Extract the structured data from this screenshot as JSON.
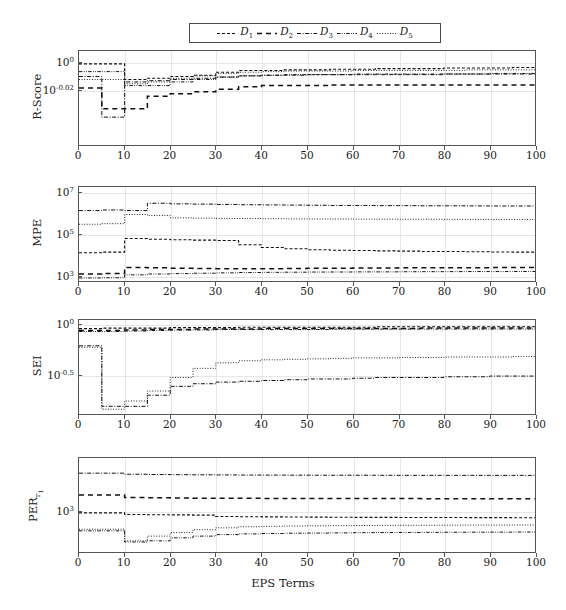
{
  "figure": {
    "xlabel": "EPS Terms",
    "legend_position": "top-center",
    "grid": true
  },
  "legend": {
    "entries": [
      {
        "label": "D",
        "sub": "1",
        "dash": "short-dash",
        "name": "legend-item-d1"
      },
      {
        "label": "D",
        "sub": "2",
        "dash": "long-dash",
        "name": "legend-item-d2"
      },
      {
        "label": "D",
        "sub": "3",
        "dash": "dash-dot",
        "name": "legend-item-d3"
      },
      {
        "label": "D",
        "sub": "4",
        "dash": "dash-dot-dot",
        "name": "legend-item-d4"
      },
      {
        "label": "D",
        "sub": "5",
        "dash": "dotted",
        "name": "legend-item-d5"
      }
    ]
  },
  "xaxis": {
    "ticks": [
      0,
      10,
      20,
      30,
      40,
      50,
      60,
      70,
      80,
      90,
      100
    ],
    "min": 0,
    "max": 100
  },
  "chart_data": [
    {
      "type": "line",
      "title": "",
      "ylabel": "R-Score",
      "xlabel": "",
      "panel": 1,
      "yscale": "log",
      "ytick_labels": [
        "10^0",
        "10^-0.02"
      ],
      "ytick_values": [
        1.0,
        0.955
      ],
      "ylim": [
        0.87,
        1.02
      ],
      "x": [
        0,
        5,
        10,
        15,
        20,
        25,
        30,
        35,
        40,
        45,
        50,
        55,
        60,
        65,
        70,
        75,
        80,
        85,
        90,
        95,
        100
      ],
      "series": [
        {
          "name": "D1",
          "dash": "short-dash",
          "values": [
            0.998,
            0.998,
            0.972,
            0.974,
            0.977,
            0.979,
            0.984,
            0.987,
            0.987,
            0.988,
            0.988,
            0.989,
            0.989,
            0.99,
            0.99,
            0.99,
            0.991,
            0.991,
            0.991,
            0.992,
            0.992
          ]
        },
        {
          "name": "D2",
          "dash": "long-dash",
          "values": [
            0.958,
            0.925,
            0.925,
            0.945,
            0.949,
            0.952,
            0.956,
            0.96,
            0.962,
            0.962,
            0.962,
            0.963,
            0.963,
            0.963,
            0.963,
            0.963,
            0.963,
            0.963,
            0.963,
            0.963,
            0.963
          ]
        },
        {
          "name": "D3",
          "dash": "dash-dot",
          "values": [
            0.977,
            0.912,
            0.968,
            0.97,
            0.972,
            0.974,
            0.976,
            0.978,
            0.979,
            0.979,
            0.98,
            0.98,
            0.98,
            0.98,
            0.98,
            0.98,
            0.981,
            0.981,
            0.981,
            0.981,
            0.981
          ]
        },
        {
          "name": "D4",
          "dash": "dash-dot-dot",
          "values": [
            0.985,
            0.985,
            0.962,
            0.962,
            0.968,
            0.972,
            0.976,
            0.978,
            0.979,
            0.98,
            0.98,
            0.98,
            0.981,
            0.981,
            0.981,
            0.981,
            0.981,
            0.981,
            0.982,
            0.982,
            0.982
          ]
        },
        {
          "name": "D5",
          "dash": "dotted",
          "values": [
            0.972,
            0.972,
            0.965,
            0.968,
            0.974,
            0.978,
            0.982,
            0.984,
            0.985,
            0.986,
            0.986,
            0.986,
            0.987,
            0.987,
            0.987,
            0.987,
            0.987,
            0.988,
            0.988,
            0.988,
            0.988
          ]
        }
      ]
    },
    {
      "type": "line",
      "title": "",
      "ylabel": "MPE",
      "xlabel": "",
      "panel": 2,
      "yscale": "log",
      "ytick_labels": [
        "10^7",
        "10^5",
        "10^3"
      ],
      "ytick_values": [
        10000000,
        100000,
        1000
      ],
      "ylim": [
        500,
        20000000
      ],
      "x": [
        0,
        5,
        10,
        15,
        20,
        25,
        30,
        35,
        40,
        45,
        50,
        55,
        60,
        65,
        70,
        75,
        80,
        85,
        90,
        95,
        100
      ],
      "series": [
        {
          "name": "D1",
          "dash": "short-dash",
          "values": [
            12000,
            13000,
            60000,
            55000,
            52000,
            50000,
            48000,
            30000,
            22000,
            19000,
            17000,
            16000,
            15500,
            15000,
            14500,
            14000,
            13800,
            13500,
            13200,
            13000,
            12800
          ]
        },
        {
          "name": "D2",
          "dash": "long-dash",
          "values": [
            1100,
            1150,
            2300,
            2200,
            2100,
            2050,
            2000,
            2000,
            2000,
            2050,
            2100,
            2100,
            2150,
            2150,
            2200,
            2200,
            2250,
            2250,
            2280,
            2300,
            2300
          ]
        },
        {
          "name": "D3",
          "dash": "dash-dot",
          "values": [
            1400000,
            1500000,
            1400000,
            3200000,
            3000000,
            2900000,
            2800000,
            2700000,
            2650000,
            2600000,
            2550000,
            2500000,
            2500000,
            2450000,
            2450000,
            2400000,
            2400000,
            2380000,
            2350000,
            2350000,
            2330000
          ]
        },
        {
          "name": "D4",
          "dash": "dash-dot-dot",
          "values": [
            700,
            720,
            1000,
            1100,
            1150,
            1200,
            1250,
            1300,
            1330,
            1350,
            1370,
            1380,
            1400,
            1400,
            1420,
            1430,
            1440,
            1450,
            1450,
            1460,
            1470
          ]
        },
        {
          "name": "D5",
          "dash": "dotted",
          "values": [
            300000,
            320000,
            900000,
            800000,
            620000,
            600000,
            580000,
            570000,
            560000,
            550000,
            545000,
            540000,
            535000,
            530000,
            528000,
            525000,
            522000,
            520000,
            518000,
            515000,
            513000
          ]
        }
      ]
    },
    {
      "type": "line",
      "title": "",
      "ylabel": "SEI",
      "xlabel": "",
      "panel": 3,
      "yscale": "log",
      "ytick_labels": [
        "10^0",
        "10^-0.5"
      ],
      "ytick_values": [
        1.0,
        0.3162
      ],
      "ylim": [
        0.13,
        1.12
      ],
      "x": [
        0,
        5,
        10,
        15,
        20,
        25,
        30,
        35,
        40,
        45,
        50,
        55,
        60,
        65,
        70,
        75,
        80,
        85,
        90,
        95,
        100
      ],
      "series": [
        {
          "name": "D1",
          "dash": "short-dash",
          "values": [
            0.92,
            0.93,
            0.93,
            0.93,
            0.94,
            0.94,
            0.94,
            0.95,
            0.95,
            0.95,
            0.95,
            0.95,
            0.95,
            0.96,
            0.96,
            0.96,
            0.96,
            0.96,
            0.96,
            0.96,
            0.96
          ]
        },
        {
          "name": "D2",
          "dash": "long-dash",
          "values": [
            0.88,
            0.88,
            0.89,
            0.9,
            0.9,
            0.91,
            0.91,
            0.91,
            0.92,
            0.92,
            0.92,
            0.92,
            0.92,
            0.92,
            0.92,
            0.93,
            0.93,
            0.93,
            0.93,
            0.93,
            0.93
          ]
        },
        {
          "name": "D3",
          "dash": "dash-dot",
          "values": [
            0.62,
            0.155,
            0.155,
            0.2,
            0.245,
            0.26,
            0.27,
            0.275,
            0.28,
            0.285,
            0.29,
            0.29,
            0.295,
            0.3,
            0.3,
            0.3,
            0.305,
            0.305,
            0.31,
            0.31,
            0.31
          ]
        },
        {
          "name": "D4",
          "dash": "dash-dot-dot",
          "values": [
            0.86,
            0.86,
            0.87,
            0.88,
            0.89,
            0.89,
            0.9,
            0.9,
            0.9,
            0.9,
            0.9,
            0.91,
            0.91,
            0.91,
            0.91,
            0.91,
            0.91,
            0.91,
            0.91,
            0.91,
            0.91
          ]
        },
        {
          "name": "D5",
          "dash": "dotted",
          "values": [
            0.6,
            0.145,
            0.175,
            0.22,
            0.3,
            0.37,
            0.42,
            0.44,
            0.45,
            0.455,
            0.46,
            0.465,
            0.47,
            0.47,
            0.475,
            0.475,
            0.48,
            0.48,
            0.48,
            0.485,
            0.485
          ]
        }
      ]
    },
    {
      "type": "line",
      "title": "",
      "ylabel": "PER r1",
      "xlabel": "EPS Terms",
      "panel": 4,
      "yscale": "log",
      "ytick_labels": [
        "10^3"
      ],
      "ytick_values": [
        1000
      ],
      "ylim": [
        60,
        40000
      ],
      "x": [
        0,
        5,
        10,
        15,
        20,
        25,
        30,
        35,
        40,
        45,
        50,
        55,
        60,
        65,
        70,
        75,
        80,
        85,
        90,
        95,
        100
      ],
      "series": [
        {
          "name": "D1",
          "dash": "short-dash",
          "values": [
            900,
            900,
            800,
            790,
            780,
            770,
            700,
            690,
            680,
            675,
            670,
            665,
            660,
            658,
            655,
            652,
            650,
            648,
            645,
            643,
            640
          ]
        },
        {
          "name": "D2",
          "dash": "long-dash",
          "values": [
            3100,
            3100,
            2600,
            2550,
            2500,
            2480,
            2460,
            2450,
            2440,
            2430,
            2425,
            2420,
            2415,
            2410,
            2408,
            2405,
            2402,
            2400,
            2398,
            2396,
            2395
          ]
        },
        {
          "name": "D3",
          "dash": "dash-dot",
          "values": [
            14000,
            14000,
            13000,
            12800,
            12600,
            12500,
            12400,
            12300,
            12250,
            12200,
            12180,
            12150,
            12120,
            12100,
            12080,
            12060,
            12050,
            12040,
            12030,
            12020,
            12010
          ]
        },
        {
          "name": "D4",
          "dash": "dash-dot-dot",
          "values": [
            260,
            260,
            120,
            130,
            160,
            180,
            200,
            210,
            215,
            220,
            222,
            225,
            228,
            230,
            232,
            234,
            235,
            236,
            237,
            238,
            240
          ]
        },
        {
          "name": "D5",
          "dash": "dotted",
          "values": [
            290,
            290,
            130,
            180,
            230,
            280,
            320,
            345,
            355,
            362,
            368,
            372,
            375,
            378,
            380,
            382,
            384,
            385,
            386,
            388,
            390
          ]
        }
      ]
    }
  ]
}
